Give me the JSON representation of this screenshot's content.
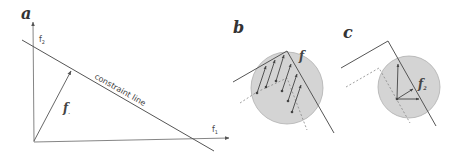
{
  "panels": [
    {
      "id": "a",
      "label": "a",
      "axes": {
        "x_label": "f",
        "x_sub": "1",
        "y_label": "f",
        "y_sub": "2"
      },
      "vector_label": "f",
      "vector_sub": ".",
      "constraint_label": "constraint line"
    },
    {
      "id": "b",
      "label": "b",
      "vector_label": "f"
    },
    {
      "id": "c",
      "label": "c",
      "vector_label": "f",
      "vector_sub": "2"
    }
  ],
  "colors": {
    "line": "#555555",
    "circle_fill": "#d4d4d4",
    "circle_stroke": "#aaaaaa",
    "dashed": "#888888"
  }
}
